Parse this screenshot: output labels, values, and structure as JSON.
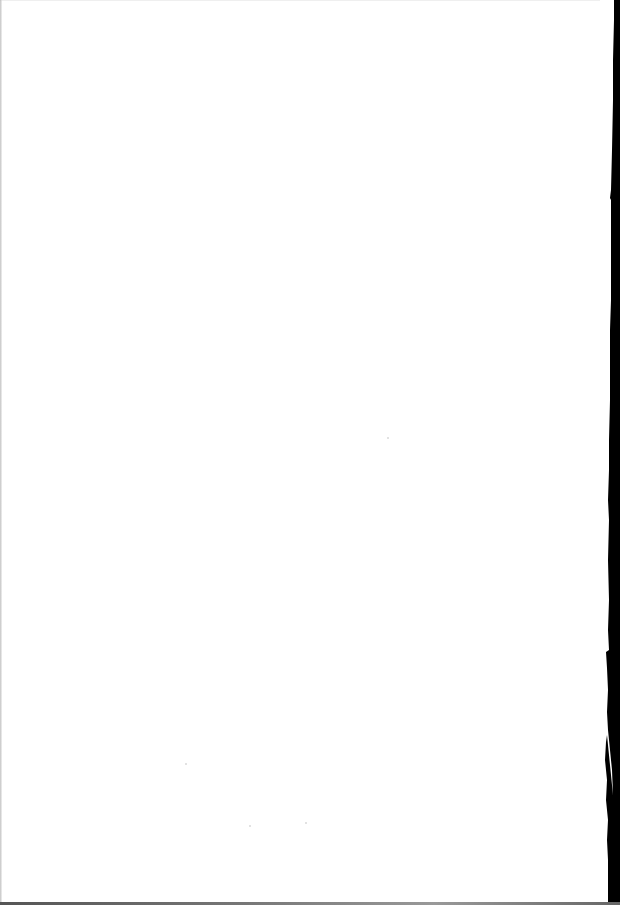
{
  "page": {
    "type": "scanned-blank-page",
    "background_color": "#ffffff",
    "edge_color": "#000000",
    "text_content": ""
  }
}
